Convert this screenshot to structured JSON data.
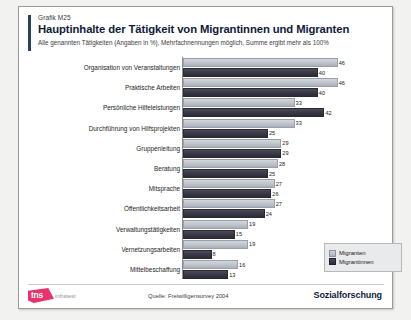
{
  "header": {
    "kicker": "Grafik M25",
    "title": "Hauptinhalte der Tätigkeit von Migrantinnen und Migranten",
    "subtitle": "Alle genannten Tätigkeiten (Angaben in %), Mehrfachnennungen möglich, Summe ergibt mehr als 100%"
  },
  "legend": {
    "items": [
      {
        "label": "Migranten",
        "color": "#c3c7ce"
      },
      {
        "label": "Migrantinnen",
        "color": "#3a3a48"
      }
    ]
  },
  "footer": {
    "logo_mark": "tns",
    "logo_word": "infratest",
    "source": "Quelle: Freiwilligensurvey 2004",
    "division": "Sozialforschung",
    "brand_color": "#e8336d"
  },
  "chart_data": {
    "type": "bar",
    "orientation": "horizontal",
    "title": "Hauptinhalte der Tätigkeit von Migrantinnen und Migranten",
    "subtitle": "Alle genannten Tätigkeiten (Angaben in %), Mehrfachnennungen möglich, Summe ergibt mehr als 100%",
    "xlabel": "",
    "ylabel": "",
    "xlim": [
      0,
      50
    ],
    "grid": false,
    "legend_position": "middle-right",
    "categories": [
      "Organisation von Veranstaltungen",
      "Praktische Arbeiten",
      "Persönliche Hilfeleistungen",
      "Durchführung von Hilfsprojekten",
      "Gruppenleitung",
      "Beratung",
      "Mitsprache",
      "Öffentlichkeitsarbeit",
      "Verwaltungstätigkeiten",
      "Vernetzungsarbeiten",
      "Mittelbeschaffung"
    ],
    "series": [
      {
        "name": "Migranten",
        "values": [
          46,
          46,
          33,
          33,
          29,
          28,
          27,
          27,
          19,
          19,
          16
        ]
      },
      {
        "name": "Migrantinnen",
        "values": [
          40,
          40,
          42,
          25,
          29,
          25,
          26,
          24,
          15,
          8,
          13
        ]
      }
    ],
    "source": "Quelle: Freiwilligensurvey 2004"
  }
}
